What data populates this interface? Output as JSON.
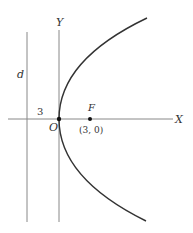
{
  "diagram": {
    "type": "parabola",
    "equation_implied": "y^2 = 12x",
    "labels": {
      "y_axis": "Y",
      "x_axis": "X",
      "directrix": "d",
      "origin": "O",
      "focus": "F",
      "focus_coords": "(3, 0)",
      "distance": "3"
    },
    "colors": {
      "stroke": "#333333",
      "axis": "#888888"
    }
  }
}
